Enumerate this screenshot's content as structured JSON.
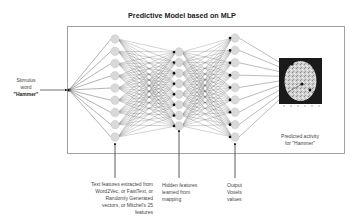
{
  "title": "Predictive Model  based on MLP",
  "input": {
    "lines": [
      "Stimulus",
      "word",
      "\"Hammer\""
    ]
  },
  "layers": [
    {
      "name": "text-features",
      "node_count": 9
    },
    {
      "name": "hidden-features",
      "node_count": 8
    },
    {
      "name": "output-voxels",
      "node_count": 9
    }
  ],
  "annotations": {
    "text_features": [
      "Text features extracted from",
      "Word2Vec, or FastText, or",
      "Randomly Generated",
      "vectors, or Mitchel's 25",
      "features"
    ],
    "hidden_features": [
      "Hidden features",
      "learned from",
      "mapping"
    ],
    "output_voxels": [
      "Output",
      "Voxels",
      "values"
    ],
    "predicted": [
      "Predicted activity",
      "for \"Hammer\""
    ]
  },
  "brain_image": {
    "label": "predicted-brain-activity-map",
    "axis_ticks": [
      "1",
      "2",
      "3",
      "4",
      "5",
      "6"
    ]
  },
  "colors": {
    "node_fill": "#d9d9d9",
    "node_stroke": "#c4c4c4",
    "edge": "#555555",
    "frame": "#888888",
    "brain_bg": "#1a1a1a"
  }
}
